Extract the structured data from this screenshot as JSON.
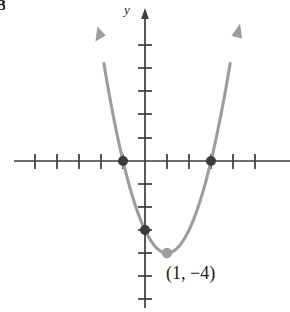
{
  "figure": {
    "panel_letter": "B",
    "y_axis_label": "y",
    "vertex_annotation": "(1, −4)"
  },
  "colors": {
    "axis": "#3b3b3b",
    "curve": "#9d9d9d",
    "intercept_dot": "#3b3b3b",
    "vertex_dot": "#9d9d9d",
    "background": "#ffffff",
    "text": "#1a1a1a"
  },
  "chart_data": {
    "type": "line",
    "title": "",
    "xlabel": "",
    "ylabel": "y",
    "grid": false,
    "legend": null,
    "function": "y = (x - 1)^2 - 4",
    "equivalent_form": "y = x^2 - 2x - 3",
    "xlim": [
      -5.9,
      6.4
    ],
    "ylim": [
      -6.6,
      6.2
    ],
    "x_tick_values": [
      -5,
      -4,
      -3,
      -2,
      -1,
      1,
      2,
      3,
      4,
      5
    ],
    "y_tick_values": [
      -6,
      -5,
      -4,
      -3,
      -2,
      -1,
      1,
      2,
      3,
      4,
      5
    ],
    "tick_labels_shown": false,
    "x": [
      -1.8,
      -1.6,
      -1.4,
      -1.2,
      -1.0,
      -0.8,
      -0.6,
      -0.4,
      -0.2,
      0.0,
      0.2,
      0.4,
      0.6,
      0.8,
      1.0,
      1.2,
      1.4,
      1.6,
      1.8,
      2.0,
      2.2,
      2.4,
      2.6,
      2.8,
      3.0,
      3.2,
      3.4,
      3.6,
      3.8
    ],
    "y": [
      3.84,
      2.76,
      1.76,
      0.84,
      0.0,
      -0.76,
      -1.44,
      -2.04,
      -2.56,
      -3.0,
      -3.36,
      -3.64,
      -3.84,
      -3.96,
      -4.0,
      -3.96,
      -3.84,
      -3.64,
      -3.36,
      -3.0,
      -2.56,
      -2.04,
      -1.44,
      -0.76,
      0.0,
      0.84,
      1.76,
      2.76,
      3.84
    ],
    "annotations": [
      {
        "label": "(1, −4)",
        "x": 1,
        "y": -4,
        "role": "vertex"
      }
    ],
    "points": [
      {
        "x": -1,
        "y": 0,
        "role": "x-intercept",
        "style": "solid-dark"
      },
      {
        "x": 3,
        "y": 0,
        "role": "x-intercept",
        "style": "solid-dark"
      },
      {
        "x": 0,
        "y": -3,
        "role": "y-intercept",
        "style": "solid-dark"
      },
      {
        "x": 1,
        "y": -4,
        "role": "vertex",
        "style": "solid-gray"
      }
    ],
    "arrows": [
      {
        "at": [
          -1.85,
          4.1
        ],
        "direction": "up-left",
        "role": "curve-end-left"
      },
      {
        "at": [
          3.9,
          4.6
        ],
        "direction": "up-right",
        "role": "curve-end-right"
      }
    ]
  }
}
